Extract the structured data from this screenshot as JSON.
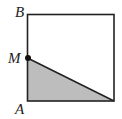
{
  "figure": {
    "type": "geometry-diagram",
    "shape": "square",
    "labels": {
      "top_left": "B",
      "midpoint": "M",
      "bottom_left": "A"
    },
    "shaded_region": "triangle A-M-bottom-right-corner",
    "colors": {
      "outline": "#222222",
      "shade": "#bdbdbd",
      "point": "#111111",
      "background": "#ffffff"
    }
  }
}
